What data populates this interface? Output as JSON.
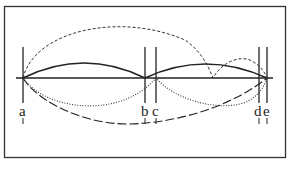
{
  "diagram": {
    "type": "string-vibration / arc diagram",
    "points": [
      {
        "id": "a",
        "label": "a",
        "x": 23
      },
      {
        "id": "b",
        "label": "b",
        "x": 145
      },
      {
        "id": "c",
        "label": "c",
        "x": 156
      },
      {
        "id": "d",
        "label": "d",
        "x": 259
      },
      {
        "id": "e",
        "label": "e",
        "x": 267
      }
    ],
    "curves": [
      {
        "name": "solid-arc-a-b",
        "style": "solid"
      },
      {
        "name": "solid-arc-c-e",
        "style": "solid"
      },
      {
        "name": "short-dashed-curve",
        "style": "dashed"
      },
      {
        "name": "dotted-curve",
        "style": "dotted"
      },
      {
        "name": "long-dashed-curve",
        "style": "long-dashed"
      }
    ],
    "colors": {
      "line": "#222222",
      "background": "#ffffff"
    }
  }
}
